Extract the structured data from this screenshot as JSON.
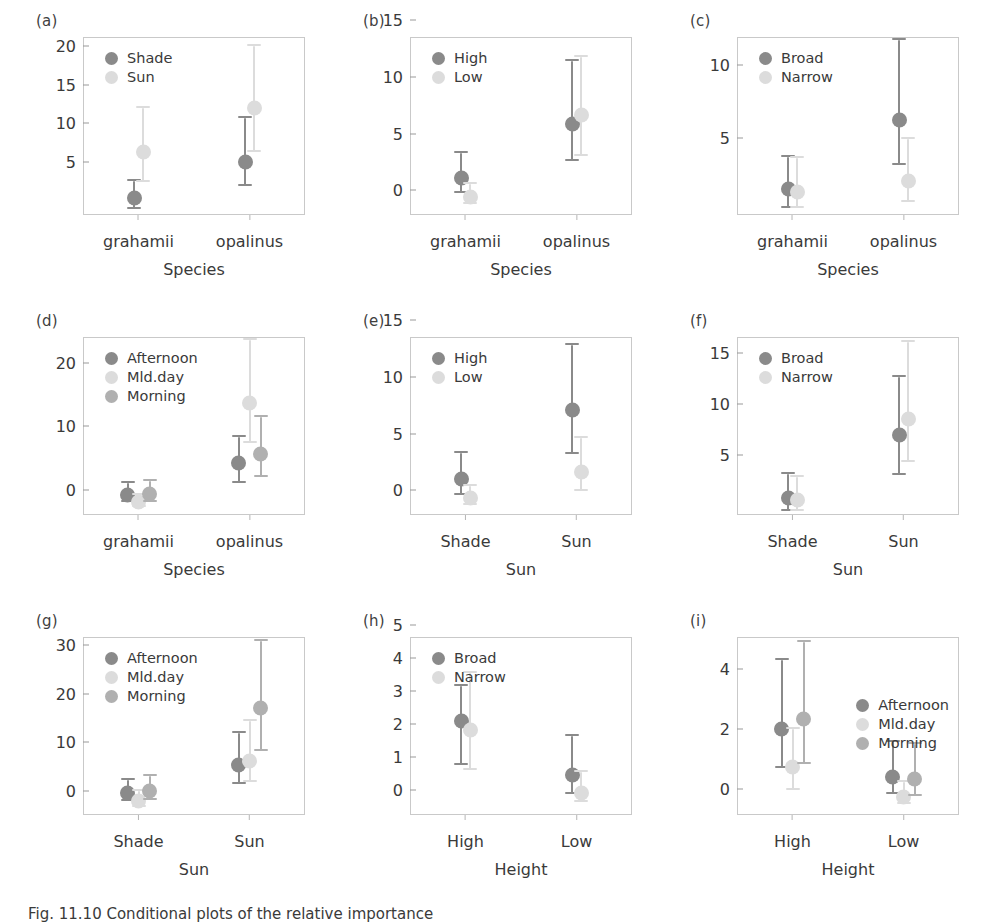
{
  "figure": {
    "caption": "Fig. 11.10   Conditional plots of the relative importance",
    "colors": {
      "dark": "#8a8a8a",
      "light": "#dcdcdc",
      "mid": "#b0b0b0",
      "frame": "#c9c9c9",
      "text": "#3a3a3a"
    }
  },
  "chart_data": [
    {
      "type": "scatter",
      "panel": "(a)",
      "title": "",
      "xlabel": "Species",
      "ylabel": "",
      "categories": [
        "grahamii",
        "opalinus"
      ],
      "yticks": [
        5,
        10,
        15,
        20
      ],
      "ylim": [
        0.6,
        23.6
      ],
      "legend_position": "left",
      "legend": [
        "Shade",
        "Sun"
      ],
      "series": [
        {
          "name": "Shade",
          "color": "dark",
          "values": [
            2.8,
            7.5
          ],
          "lower": [
            1.4,
            4.3
          ],
          "upper": [
            5.0,
            13.1
          ]
        },
        {
          "name": "Sun",
          "color": "light",
          "values": [
            8.7,
            14.4
          ],
          "lower": [
            4.9,
            8.8
          ],
          "upper": [
            14.4,
            22.4
          ]
        }
      ]
    },
    {
      "type": "scatter",
      "panel": "(b)",
      "title": "",
      "xlabel": "Species",
      "ylabel": "",
      "categories": [
        "grahamii",
        "opalinus"
      ],
      "yticks": [
        0,
        5,
        10,
        15
      ],
      "ylim": [
        -0.5,
        15.2
      ],
      "legend_position": "left",
      "legend": [
        "High",
        "Low"
      ],
      "series": [
        {
          "name": "High",
          "color": "dark",
          "values": [
            2.8,
            7.5
          ],
          "lower": [
            1.4,
            4.3
          ],
          "upper": [
            5.0,
            13.1
          ]
        },
        {
          "name": "Low",
          "color": "light",
          "values": [
            1.1,
            8.3
          ],
          "lower": [
            0.5,
            4.7
          ],
          "upper": [
            2.2,
            13.4
          ]
        }
      ]
    },
    {
      "type": "scatter",
      "panel": "(c)",
      "title": "",
      "xlabel": "Species",
      "ylabel": "",
      "categories": [
        "grahamii",
        "opalinus"
      ],
      "yticks": [
        5,
        10
      ],
      "ylim": [
        1.0,
        13.2
      ],
      "legend_position": "left",
      "legend": [
        "Broad",
        "Narrow"
      ],
      "series": [
        {
          "name": "Broad",
          "color": "dark",
          "values": [
            2.8,
            7.5
          ],
          "lower": [
            1.5,
            4.4
          ],
          "upper": [
            5.0,
            13.0
          ]
        },
        {
          "name": "Narrow",
          "color": "light",
          "values": [
            2.6,
            3.3
          ],
          "lower": [
            1.5,
            1.9
          ],
          "upper": [
            4.9,
            6.2
          ]
        }
      ]
    },
    {
      "type": "scatter",
      "panel": "(d)",
      "title": "",
      "xlabel": "Species",
      "ylabel": "",
      "categories": [
        "grahamii",
        "opalinus"
      ],
      "yticks": [
        0,
        10,
        20
      ],
      "ylim": [
        -0.9,
        27.0
      ],
      "legend_position": "left",
      "legend": [
        "Afternoon",
        "Mld.day",
        "Morning"
      ],
      "series": [
        {
          "name": "Afternoon",
          "color": "dark",
          "values": [
            2.2,
            7.3
          ],
          "lower": [
            1.1,
            4.1
          ],
          "upper": [
            4.1,
            11.3
          ]
        },
        {
          "name": "Mld.day",
          "color": "light",
          "values": [
            1.1,
            16.6
          ],
          "lower": [
            0.4,
            10.4
          ],
          "upper": [
            2.3,
            26.5
          ]
        },
        {
          "name": "Morning",
          "color": "mid",
          "values": [
            2.4,
            8.7
          ],
          "lower": [
            1.1,
            5.0
          ],
          "upper": [
            4.4,
            14.5
          ]
        }
      ]
    },
    {
      "type": "scatter",
      "panel": "(e)",
      "title": "",
      "xlabel": "Sun",
      "ylabel": "",
      "categories": [
        "Shade",
        "Sun"
      ],
      "yticks": [
        0,
        5,
        10,
        15
      ],
      "ylim": [
        -0.5,
        15.2
      ],
      "legend_position": "left",
      "legend": [
        "High",
        "Low"
      ],
      "series": [
        {
          "name": "High",
          "color": "dark",
          "values": [
            2.7,
            8.8
          ],
          "lower": [
            1.3,
            4.9
          ],
          "upper": [
            5.0,
            14.5
          ]
        },
        {
          "name": "Low",
          "color": "light",
          "values": [
            1.0,
            3.3
          ],
          "lower": [
            0.4,
            1.6
          ],
          "upper": [
            2.1,
            6.3
          ]
        }
      ]
    },
    {
      "type": "scatter",
      "panel": "(f)",
      "title": "",
      "xlabel": "Sun",
      "ylabel": "",
      "categories": [
        "Shade",
        "Sun"
      ],
      "yticks": [
        5,
        10,
        15
      ],
      "ylim": [
        1.0,
        18.4
      ],
      "legend_position": "left",
      "legend": [
        "Broad",
        "Narrow"
      ],
      "series": [
        {
          "name": "Broad",
          "color": "dark",
          "values": [
            2.7,
            8.8
          ],
          "lower": [
            1.4,
            4.9
          ],
          "upper": [
            5.0,
            14.5
          ]
        },
        {
          "name": "Narrow",
          "color": "light",
          "values": [
            2.5,
            10.4
          ],
          "lower": [
            1.4,
            6.2
          ],
          "upper": [
            4.7,
            17.9
          ]
        }
      ]
    },
    {
      "type": "scatter",
      "panel": "(g)",
      "title": "",
      "xlabel": "Sun",
      "ylabel": "",
      "categories": [
        "Shade",
        "Sun"
      ],
      "yticks": [
        0,
        10,
        20,
        30
      ],
      "ylim": [
        -1.0,
        35.5
      ],
      "legend_position": "left",
      "legend": [
        "Afternoon",
        "Mld.day",
        "Morning"
      ],
      "series": [
        {
          "name": "Afternoon",
          "color": "dark",
          "values": [
            3.6,
            9.2
          ],
          "lower": [
            1.8,
            5.3
          ],
          "upper": [
            6.2,
            15.9
          ]
        },
        {
          "name": "Mld.day",
          "color": "light",
          "values": [
            1.9,
            10.1
          ],
          "lower": [
            0.7,
            5.7
          ],
          "upper": [
            3.9,
            18.3
          ]
        },
        {
          "name": "Morning",
          "color": "mid",
          "values": [
            3.9,
            21.0
          ],
          "lower": [
            2.0,
            12.1
          ],
          "upper": [
            7.0,
            34.7
          ]
        }
      ]
    },
    {
      "type": "scatter",
      "panel": "(h)",
      "title": "",
      "xlabel": "Height",
      "ylabel": "",
      "categories": [
        "High",
        "Low"
      ],
      "yticks": [
        0,
        1,
        2,
        3,
        4,
        5
      ],
      "ylim": [
        -0.18,
        5.2
      ],
      "legend_position": "left",
      "legend": [
        "Broad",
        "Narrow"
      ],
      "series": [
        {
          "name": "Broad",
          "color": "dark",
          "values": [
            2.66,
            1.02
          ],
          "lower": [
            1.34,
            0.46
          ],
          "upper": [
            3.73,
            2.2
          ]
        },
        {
          "name": "Narrow",
          "color": "light",
          "values": [
            2.4,
            0.5
          ],
          "lower": [
            1.18,
            0.21
          ],
          "upper": [
            4.1,
            1.13
          ]
        }
      ]
    },
    {
      "type": "scatter",
      "panel": "(i)",
      "title": "",
      "xlabel": "Height",
      "ylabel": "",
      "categories": [
        "High",
        "Low"
      ],
      "yticks": [
        0,
        2,
        4
      ],
      "ylim": [
        -0.25,
        5.7
      ],
      "legend_position": "right",
      "legend": [
        "Afternoon",
        "Mld.day",
        "Morning"
      ],
      "series": [
        {
          "name": "Afternoon",
          "color": "dark",
          "values": [
            2.64,
            1.03
          ],
          "lower": [
            1.33,
            0.46
          ],
          "upper": [
            4.93,
            2.18
          ]
        },
        {
          "name": "Mld.day",
          "color": "light",
          "values": [
            1.36,
            0.35
          ],
          "lower": [
            0.6,
            0.13
          ],
          "upper": [
            2.62,
            0.85
          ]
        },
        {
          "name": "Morning",
          "color": "mid",
          "values": [
            2.97,
            0.96
          ],
          "lower": [
            1.44,
            0.38
          ],
          "upper": [
            5.55,
            2.12
          ]
        }
      ]
    }
  ]
}
